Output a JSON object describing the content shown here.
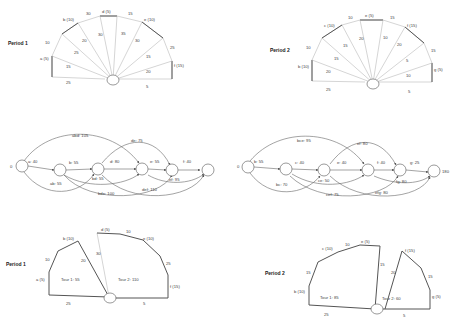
{
  "fans": [
    {
      "title": "Period 1",
      "depot_edges": [
        "25",
        "15",
        "25",
        "20",
        "30",
        "35",
        "30",
        "15",
        "20",
        "5"
      ],
      "nodes": [
        "a (5)",
        "b (10)",
        "d (5)",
        "e (10)",
        "f (15)"
      ],
      "perimeter": [
        "10",
        "30",
        "15",
        "25"
      ]
    },
    {
      "title": "Period 2",
      "depot_edges": [
        "25",
        "20",
        "15",
        "15",
        "20",
        "10",
        "20",
        "5",
        "10",
        "5"
      ],
      "nodes": [
        "b (10)",
        "c (10)",
        "e (5)",
        "f (15)",
        "g (5)"
      ],
      "perimeter": [
        "10",
        "10",
        "15",
        "15"
      ]
    }
  ],
  "graphs": [
    {
      "start": "0",
      "end": "",
      "nodes_labels": [
        "a: 40",
        "b: 55",
        "d: 80",
        "e: 55",
        "f: 40"
      ],
      "arcs": [
        "abd: 105",
        "ab: 55",
        "de: 75",
        "bd: 55",
        "bde: 100",
        "def: 110",
        "ef: 95"
      ]
    },
    {
      "start": "0",
      "end": "180",
      "nodes_labels": [
        "b: 55",
        "c: 40",
        "e: 40",
        "f: 40",
        "g: 25"
      ],
      "arcs": [
        "bce: 95",
        "bc: 70",
        "ef: 80",
        "ce: 50",
        "cef: 75",
        "efg: 80",
        "fg: 80"
      ]
    }
  ],
  "tours": [
    {
      "title": "Period 1",
      "tour1": "Tour 1: 55",
      "tour2": "Tour 2: 110",
      "nodes": [
        "a (5)",
        "b (10)",
        "d (5)",
        "e (10)",
        "f (15)"
      ],
      "edges": [
        "10",
        "20",
        "30",
        "10",
        "25",
        "25",
        "5"
      ]
    },
    {
      "title": "Period 2",
      "tour1": "Tour 1: 85",
      "tour2": "Tour 2: 60",
      "nodes": [
        "b (10)",
        "c (10)",
        "e (5)",
        "f (15)",
        "g (5)"
      ],
      "edges": [
        "15",
        "10",
        "15",
        "20",
        "15",
        "25",
        "5"
      ]
    }
  ]
}
